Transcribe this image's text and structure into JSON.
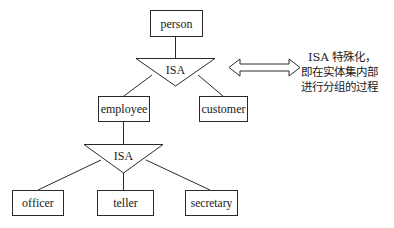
{
  "diagram": {
    "type": "ER specialization (ISA) diagram",
    "entities": {
      "person": "person",
      "employee": "employee",
      "customer": "customer",
      "officer": "officer",
      "teller": "teller",
      "secretary": "secretary"
    },
    "isa_nodes": {
      "top": "ISA",
      "bottom": "ISA"
    },
    "note": {
      "lines": [
        "ISA 特殊化，",
        "即在实体集内部",
        "进行分组的过程"
      ]
    },
    "colors": {
      "stroke": "#2a2a2a",
      "background": "#ffffff",
      "text": "#1a1a1a"
    }
  }
}
